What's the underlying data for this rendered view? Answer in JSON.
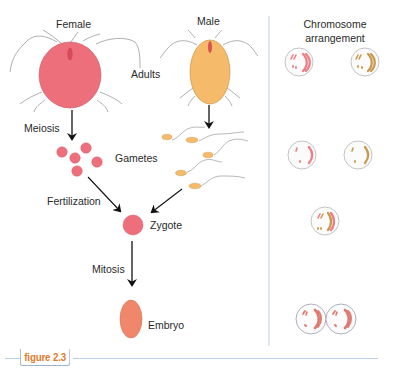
{
  "labels": {
    "female": "Female",
    "male": "Male",
    "adults": "Adults",
    "meiosis": "Meiosis",
    "gametes": "Gametes",
    "fertilization": "Fertilization",
    "zygote": "Zygote",
    "mitosis": "Mitosis",
    "embryo": "Embryo",
    "chromosome_header_line1": "Chromosome",
    "chromosome_header_line2": "arrangement"
  },
  "caption": {
    "figure_label": "figure 2.3"
  },
  "colors": {
    "female_body": "#ee6f7c",
    "male_body": "#f5bb6b",
    "embryo": "#f0876a",
    "pink_chromosome": "#ee7d86",
    "tan_chromosome": "#c99a4e",
    "divider": "#c7d9ec",
    "caption_text": "#e07a2e",
    "arrow": "#111111"
  },
  "chromosome_panel": {
    "rows": [
      {
        "stage": "Adults",
        "cells": [
          "pink-diploid",
          "tan-diploid"
        ]
      },
      {
        "stage": "Gametes",
        "cells": [
          "pink-haploid",
          "tan-haploid"
        ]
      },
      {
        "stage": "Zygote",
        "cells": [
          "mixed-diploid"
        ]
      },
      {
        "stage": "Embryo",
        "cells": [
          "dividing-cell-left",
          "dividing-cell-right"
        ]
      }
    ]
  }
}
